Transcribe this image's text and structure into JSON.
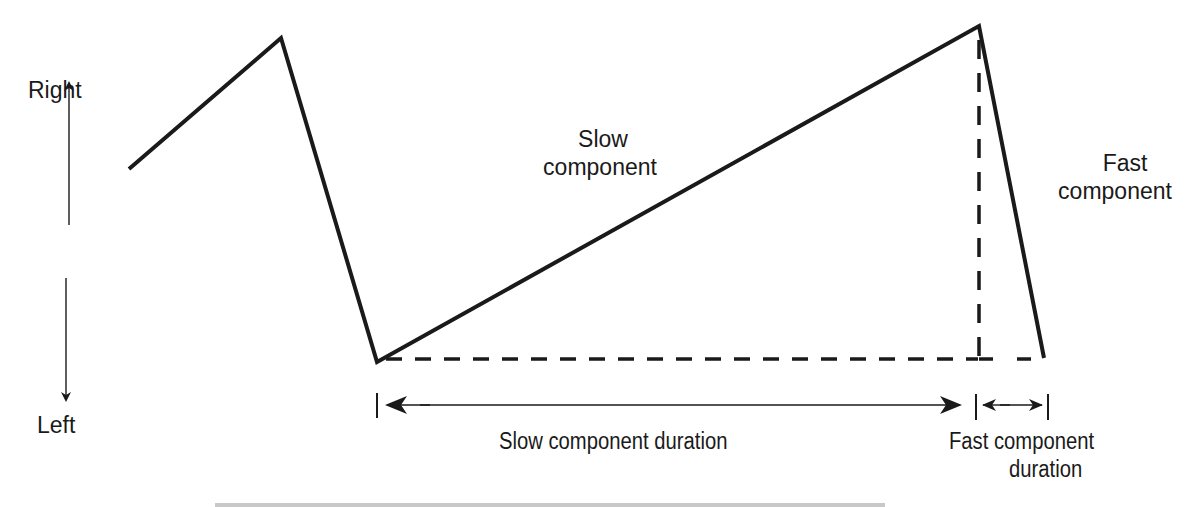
{
  "figure": {
    "type": "nystagmus-waveform-diagram",
    "axis": {
      "top_label": "Right",
      "bottom_label": "Left"
    },
    "labels": {
      "slow_component": [
        "Slow",
        "component"
      ],
      "fast_component": [
        "Fast",
        "component"
      ],
      "slow_duration": "Slow component duration",
      "fast_duration": [
        "Fast component",
        "duration"
      ]
    },
    "waveform_points": [
      [
        129,
        169
      ],
      [
        281,
        38
      ],
      [
        377,
        362
      ],
      [
        979,
        26
      ],
      [
        1044,
        358
      ]
    ],
    "colors": {
      "line": "#1a1a1a",
      "background": "#ffffff"
    }
  }
}
